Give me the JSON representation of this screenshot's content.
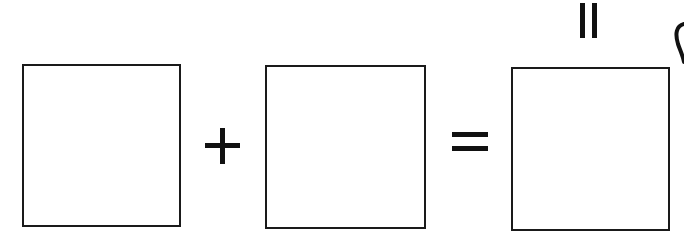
{
  "diagram": {
    "type": "equation-template",
    "boxes": [
      {
        "id": "addend-1",
        "value": ""
      },
      {
        "id": "addend-2",
        "value": ""
      },
      {
        "id": "sum",
        "value": ""
      }
    ],
    "operators": [
      {
        "symbol": "+",
        "name": "plus"
      },
      {
        "symbol": "=",
        "name": "equals"
      }
    ],
    "top_mark": "||",
    "colors": {
      "stroke": "#1a1a1a",
      "background": "#ffffff"
    }
  }
}
